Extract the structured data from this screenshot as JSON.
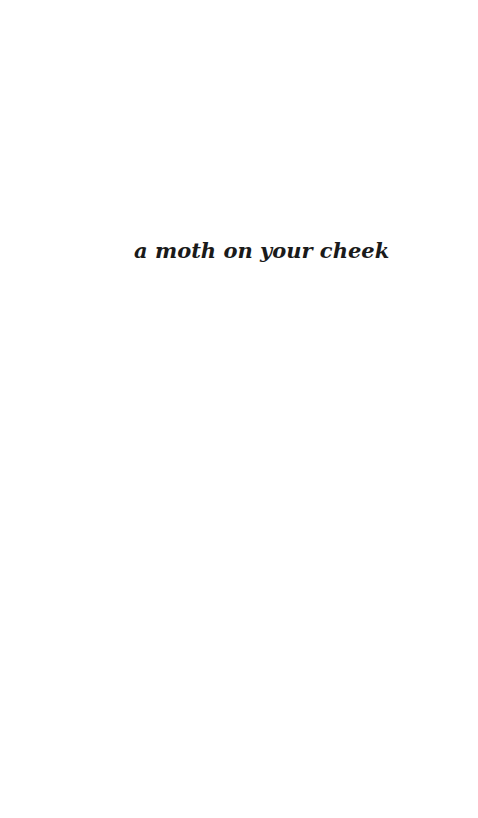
{
  "page": {
    "background_color": "#ffffff",
    "text_color": "#1a1a1a"
  },
  "half_title": {
    "text": "a moth on your cheek"
  }
}
